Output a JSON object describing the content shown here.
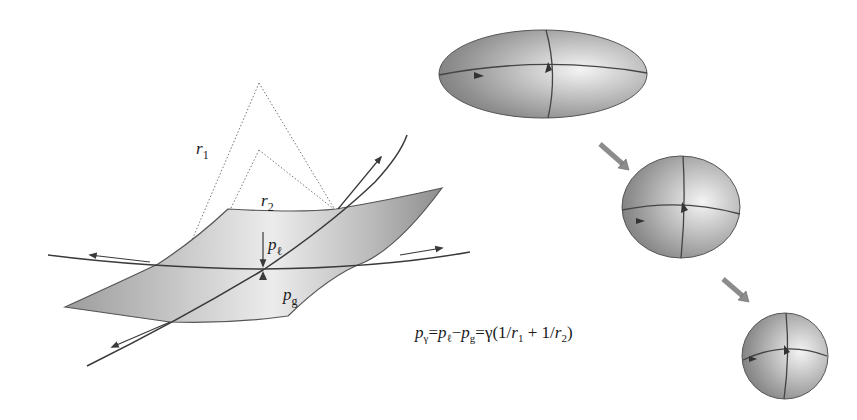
{
  "figure": {
    "type": "physics-diagram",
    "topic": "Laplace pressure across a curved interface",
    "left_panel": {
      "radii": [
        {
          "symbol": "r",
          "subscript": "1"
        },
        {
          "symbol": "r",
          "subscript": "2"
        }
      ],
      "pressures": [
        {
          "symbol": "p",
          "subscript": "ℓ"
        },
        {
          "symbol": "p",
          "subscript": "g"
        }
      ]
    },
    "equation": {
      "text": "pγ = pℓ − pg = γ(1/r1 + 1/r2)",
      "lhs_symbol": "p",
      "lhs_subscript": "γ",
      "eq1": "=",
      "t1_symbol": "p",
      "t1_subscript": "ℓ",
      "minus": "−",
      "t2_symbol": "p",
      "t2_subscript": "g",
      "eq2": "=",
      "rhs_prefix": "γ(1/",
      "r1_symbol": "r",
      "r1_subscript": "1",
      "plus": " + 1/",
      "r2_symbol": "r",
      "r2_subscript": "2",
      "rhs_suffix": ")"
    },
    "right_panel": {
      "description": "Elongated droplet relaxing to a sphere under surface tension",
      "stages": [
        "ellipsoid-elongated",
        "ellipsoid-slight",
        "sphere"
      ]
    },
    "colors": {
      "surface_dark": "#9a9a9a",
      "surface_light": "#e8e8e8",
      "line": "#3a3a3a",
      "dotted": "#777777",
      "arrow_fill": "#8c8c8c"
    }
  }
}
